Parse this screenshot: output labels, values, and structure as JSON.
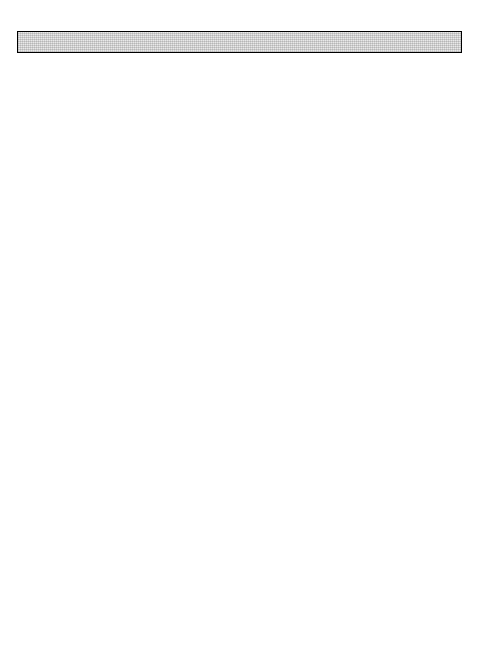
{
  "header": {
    "page_number": "113"
  },
  "legend": {
    "items": [
      {
        "label": "Gastroenteritis",
        "swatch": "light-stipple",
        "color": "#e8e8e8"
      },
      {
        "label": "Cholera",
        "swatch": "dark-grey",
        "color": "#8e8e8e"
      }
    ]
  },
  "axis": {
    "ylabel": "Cases",
    "months": [
      "J",
      "F",
      "M",
      "A",
      "M",
      "J",
      "J",
      "A",
      "S",
      "O",
      "N",
      "D"
    ]
  },
  "chart_data": [
    {
      "type": "area",
      "id": "upper",
      "title": "",
      "xlabel": "",
      "ylabel": "Cases",
      "ylim": [
        0,
        2700
      ],
      "yticks": [
        0,
        500,
        1000,
        1500,
        2000,
        2500
      ],
      "ytick_minor_step": 100,
      "grid": false,
      "legend_position": "inside-top-center",
      "panels": [
        {
          "year": "1973",
          "categories": [
            "J",
            "F",
            "M",
            "A",
            "M",
            "J",
            "J",
            "A",
            "S",
            "O",
            "N",
            "D"
          ],
          "series": [
            {
              "name": "Cholera",
              "values": [
                10,
                10,
                20,
                225,
                550,
                175,
                80,
                55,
                55,
                205,
                70,
                45
              ]
            },
            {
              "name": "Gastroenteritis",
              "values": [
                190,
                230,
                285,
                1275,
                1950,
                1175,
                440,
                395,
                555,
                500,
                355,
                150
              ]
            }
          ],
          "totals": [
            200,
            240,
            305,
            1500,
            2500,
            1350,
            520,
            450,
            610,
            705,
            425,
            195
          ]
        },
        {
          "year": "1974",
          "categories": [
            "J",
            "F",
            "M",
            "A",
            "M",
            "J",
            "J",
            "A",
            "S",
            "O",
            "N",
            "D"
          ],
          "series": [
            {
              "name": "Cholera",
              "values": [
                35,
                40,
                130,
                140,
                450,
                120,
                100,
                95,
                185,
                350,
                230,
                70
              ]
            },
            {
              "name": "Gastroenteritis",
              "values": [
                105,
                135,
                200,
                540,
                710,
                550,
                700,
                670,
                530,
                650,
                485,
                250
              ]
            }
          ],
          "totals": [
            140,
            175,
            330,
            680,
            1160,
            670,
            800,
            765,
            715,
            1000,
            715,
            320
          ]
        },
        {
          "year": "1975",
          "categories": [
            "J",
            "F",
            "M",
            "A",
            "M",
            "J",
            "J",
            "A",
            "S",
            "O",
            "N",
            "D"
          ],
          "series": [
            {
              "name": "Cholera",
              "values": [
                25,
                35,
                185,
                330,
                670,
                225,
                110,
                85,
                80,
                160,
                90,
                35
              ]
            },
            {
              "name": "Gastroenteritis",
              "values": [
                95,
                135,
                280,
                1000,
                1050,
                720,
                700,
                635,
                645,
                660,
                470,
                145
              ]
            }
          ],
          "totals": [
            120,
            170,
            465,
            1330,
            1720,
            945,
            810,
            720,
            725,
            820,
            560,
            180
          ]
        }
      ]
    },
    {
      "type": "area",
      "id": "lower",
      "title": "",
      "xlabel": "",
      "ylabel": "Cases",
      "ylim": [
        0,
        1700
      ],
      "yticks": [
        0,
        500,
        1000,
        1500
      ],
      "ytick_minor_step": 100,
      "grid": false,
      "panels": [
        {
          "year": "1976",
          "categories": [
            "J",
            "F",
            "M",
            "A",
            "M",
            "J",
            "J",
            "A",
            "S",
            "O",
            "N",
            "D"
          ],
          "series": [
            {
              "name": "Cholera",
              "values": [
                5,
                5,
                20,
                40,
                55,
                70,
                85,
                100,
                140,
                190,
                160,
                40
              ]
            },
            {
              "name": "Gastroenteritis",
              "values": [
                100,
                215,
                430,
                505,
                565,
                620,
                580,
                545,
                525,
                475,
                430,
                125
              ]
            }
          ],
          "totals": [
            105,
            220,
            450,
            545,
            620,
            690,
            665,
            645,
            665,
            665,
            590,
            165
          ]
        },
        {
          "year": "1977",
          "categories": [
            "J",
            "F",
            "M",
            "A",
            "M",
            "J",
            "J",
            "A",
            "S",
            "O",
            "N",
            "D"
          ],
          "series": [
            {
              "name": "Cholera",
              "values": [
                20,
                25,
                30,
                40,
                55,
                95,
                145,
                200,
                255,
                285,
                205,
                70
              ]
            },
            {
              "name": "Gastroenteritis",
              "values": [
                125,
                180,
                300,
                400,
                465,
                500,
                580,
                640,
                615,
                585,
                440,
                200
              ]
            }
          ],
          "totals": [
            145,
            205,
            330,
            440,
            520,
            595,
            725,
            840,
            870,
            870,
            645,
            270
          ]
        },
        {
          "year": "1978",
          "categories": [
            "J",
            "F",
            "M",
            "A",
            "M",
            "J",
            "J",
            "A",
            "S",
            "O",
            "N",
            "D"
          ],
          "series": [
            {
              "name": "Cholera",
              "values": [
                25,
                25,
                35,
                55,
                40,
                30,
                45,
                90,
                110,
                370,
                95,
                45
              ]
            },
            {
              "name": "Gastroenteritis",
              "values": [
                200,
                270,
                380,
                375,
                390,
                495,
                575,
                595,
                690,
                1330,
                700,
                230
              ]
            }
          ],
          "totals": [
            225,
            295,
            415,
            430,
            430,
            525,
            620,
            685,
            800,
            1700,
            795,
            275
          ]
        }
      ]
    }
  ]
}
